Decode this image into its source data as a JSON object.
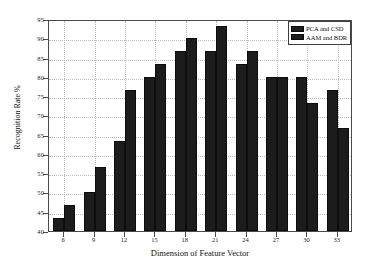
{
  "chart_data": {
    "type": "bar",
    "title": "",
    "xlabel": "Dimension of Feature Vector",
    "ylabel": "Recognition Rate %",
    "categories": [
      "6",
      "9",
      "12",
      "15",
      "18",
      "21",
      "24",
      "27",
      "30",
      "33"
    ],
    "series": [
      {
        "name": "PCA and CSD",
        "color": "#1c1c1c",
        "values": [
          43.3,
          50.0,
          63.3,
          80.0,
          86.7,
          86.7,
          83.3,
          80.0,
          80.0,
          76.7
        ]
      },
      {
        "name": "AAM and BDR",
        "color": "#1c1c1c",
        "values": [
          46.7,
          56.7,
          76.7,
          83.3,
          90.0,
          93.3,
          86.7,
          80.0,
          73.3,
          66.7
        ]
      }
    ],
    "ylim": [
      40,
      95
    ],
    "yticks": [
      40,
      45,
      50,
      55,
      60,
      65,
      70,
      75,
      80,
      85,
      90,
      95
    ],
    "ytick_labels": [
      "40",
      "45",
      "50",
      "55",
      "60",
      "65",
      "70",
      "75",
      "80",
      "85",
      "90",
      "95"
    ],
    "grid": true,
    "legend_position": "top-right"
  }
}
